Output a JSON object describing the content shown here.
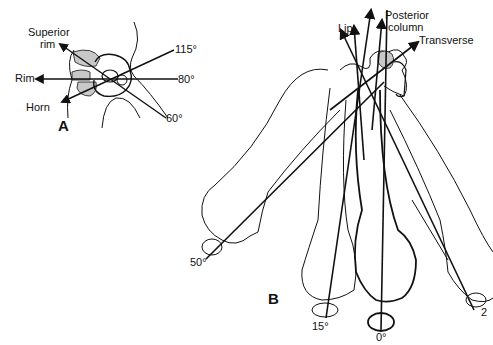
{
  "panel_a": {
    "letter": "A",
    "labels": {
      "superior_rim_line1": "Superior",
      "superior_rim_line2": "rim",
      "rim": "Rim",
      "horn": "Horn",
      "angle_115": "115°",
      "angle_80": "80°",
      "angle_60": "60°"
    }
  },
  "panel_b": {
    "letter": "B",
    "labels": {
      "lip": "Lip",
      "posterior_line1": "Posterior",
      "posterior_line2": "column",
      "transverse": "Transverse",
      "angle_50": "50°",
      "angle_15": "15°",
      "angle_0": "0°",
      "angle_25": "2"
    }
  },
  "colors": {
    "line": "#111111",
    "shade": "#c8c8c8",
    "background": "#ffffff"
  }
}
